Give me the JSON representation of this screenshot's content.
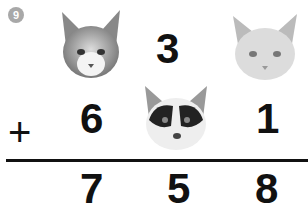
{
  "problem": {
    "number": "9",
    "operator": "+",
    "row1": {
      "hundreds": "cat-tabby-white",
      "tens": "3",
      "ones": "cat-light-gray"
    },
    "row2": {
      "hundreds": "6",
      "tens": "cat-black-white",
      "ones": "1"
    },
    "result": {
      "hundreds": "7",
      "tens": "5",
      "ones": "8"
    }
  },
  "labels": {
    "number": "9",
    "plus": "+",
    "r1_tens": "3",
    "r2_hundreds": "6",
    "r2_ones": "1",
    "res_hundreds": "7",
    "res_tens": "5",
    "res_ones": "8"
  },
  "colors": {
    "badge": "#a8a8a8",
    "text": "#111111"
  }
}
